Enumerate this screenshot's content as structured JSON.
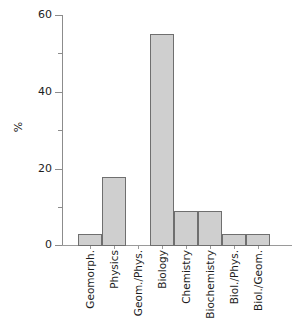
{
  "chart_data": {
    "type": "bar",
    "title": "",
    "subtitle": "",
    "xlabel": "",
    "ylabel": "%",
    "categories": [
      "Geomorph.",
      "Physics",
      "Geom./Phys.",
      "Biology",
      "Chemistry",
      "Biochemistry",
      "Biol./Phys.",
      "Biol./Geom."
    ],
    "values": [
      3,
      18,
      0,
      55,
      9,
      9,
      3,
      3
    ],
    "ylim": [
      0,
      60
    ],
    "ytick_major": [
      0,
      20,
      40,
      60
    ],
    "ytick_minor": [
      10,
      30,
      50
    ],
    "ytick_labels": [
      "0",
      "20",
      "40",
      "60"
    ],
    "grid": false,
    "legend": null,
    "legend_position": "none",
    "bar_fill_color": "#cfcfcf",
    "bar_edge_color": "#6f6f6f",
    "axis_color": "#8c8c8c",
    "text_color": "#1d1d1d",
    "background_color": "#ffffff",
    "xtick_label_rotation": 90,
    "annotations": []
  }
}
